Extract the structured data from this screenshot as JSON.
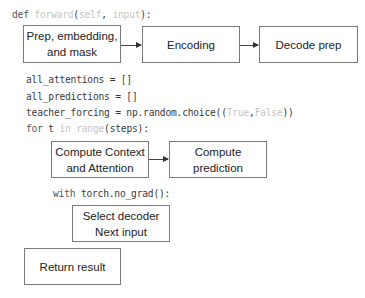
{
  "code": {
    "def_line": {
      "kw": "def",
      "name": "forward",
      "open": "(",
      "arg1": "self",
      "sep": ", ",
      "arg2": "input",
      "close": "):"
    },
    "line1": "all_attentions = []",
    "line2": "all_predictions = []",
    "line3": {
      "pre": "teacher_forcing = np.random.choice((",
      "a": "True",
      "comma": ",",
      "b": "False",
      "post": "))"
    },
    "line4": {
      "kw": "for",
      "var": " t ",
      "in": "in",
      "sp": " ",
      "fn": "range",
      "post": "(steps):"
    },
    "line5": {
      "kw": "with",
      "post": " torch.no_grad():"
    }
  },
  "boxes": {
    "prep": {
      "line1": "Prep, embedding,",
      "line2": "and mask"
    },
    "encoding": "Encoding",
    "decode_prep": "Decode prep",
    "compute_context": {
      "line1": "Compute Context",
      "line2": "and Attention"
    },
    "compute_prediction": "Compute prediction",
    "select_decoder": {
      "line1": "Select decoder",
      "line2": "Next input"
    },
    "return_result": "Return result"
  }
}
